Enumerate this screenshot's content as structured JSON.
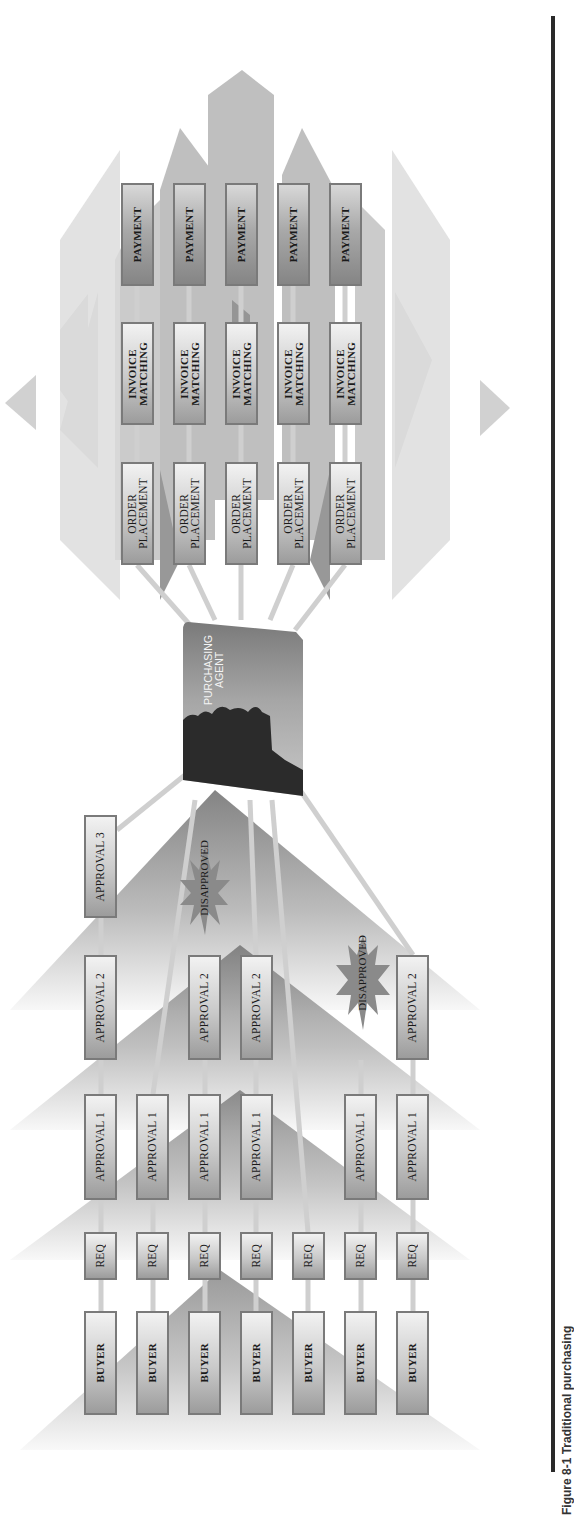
{
  "diagram": {
    "orientation": "rotated 90 degrees counter-clockwise",
    "stages": {
      "payment": {
        "label": "PAYMENT",
        "count": 5
      },
      "invoice_matching": {
        "label": "INVOICE\nMATCHING",
        "count": 5
      },
      "order_placement": {
        "label": "ORDER\nPLACEMENT",
        "count": 5
      },
      "purchasing_agent": {
        "label": "PURCHASING\nAGENT"
      },
      "approval_3": {
        "label": "APPROVAL 3",
        "count": 1
      },
      "approval_2": {
        "label": "APPROVAL 2",
        "count": 4
      },
      "approval_1": {
        "label": "APPROVAL 1",
        "count": 6
      },
      "req": {
        "label": "REQ",
        "count": 7
      },
      "buyer": {
        "label": "BUYER",
        "count": 7
      }
    },
    "disapproved_label": "DISAPPROVED",
    "disapproved_count": 2,
    "labels": {
      "payment": "PAYMENT",
      "invoice": "INVOICE\nMATCHING",
      "order": "ORDER\nPLACEMENT",
      "agent": "PURCHASING\nAGENT",
      "approval3": "APPROVAL 3",
      "approval2": "APPROVAL 2",
      "approval1": "APPROVAL 1",
      "req": "REQ",
      "buyer": "BUYER",
      "disapproved": "DISAPPROVED"
    },
    "caption": "Figure 8-1 Traditional purchasing"
  },
  "colors": {
    "box_border": "#7a7a7a",
    "agent_dark": "#2b2b2b",
    "rule": "#2a2a2a",
    "arrow_gray": "#b5b5b5"
  }
}
